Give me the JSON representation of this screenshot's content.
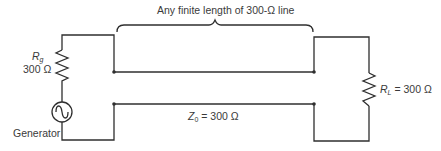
{
  "diagram": {
    "type": "circuit",
    "colors": {
      "wire": "#2f2f2f",
      "text": "#3a3a3a",
      "background": "#ffffff"
    },
    "line_label": "Any finite length of 300-Ω line",
    "generator": {
      "label": "Generator",
      "resistor_symbol": "R",
      "resistor_subscript": "g",
      "resistor_value": "300 Ω"
    },
    "load": {
      "symbol": "R",
      "subscript": "L",
      "value": "= 300 Ω"
    },
    "impedance": {
      "symbol": "Z",
      "subscript": "0",
      "value": "= 300 Ω"
    }
  }
}
